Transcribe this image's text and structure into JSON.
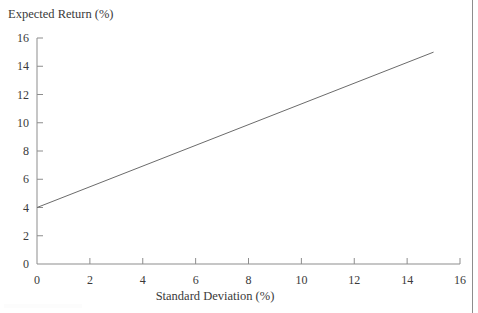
{
  "chart_data": {
    "type": "line",
    "title": "",
    "xlabel": "Standard Deviation (%)",
    "ylabel": "Expected Return (%)",
    "xlim": [
      0,
      16
    ],
    "ylim": [
      0,
      16
    ],
    "xticks": [
      0,
      2,
      4,
      6,
      8,
      10,
      12,
      14,
      16
    ],
    "xtick_labels": [
      "0",
      "2",
      "4",
      "6",
      "8",
      "10",
      "12",
      "14",
      "16"
    ],
    "yticks": [
      0,
      2,
      4,
      6,
      8,
      10,
      12,
      14,
      16
    ],
    "ytick_labels": [
      "0",
      "2",
      "4",
      "6",
      "8",
      "10",
      "12",
      "14",
      "16"
    ],
    "grid": false,
    "legend": "none",
    "series": [
      {
        "name": "Capital Market Line",
        "color": "#6b6b6b",
        "x": [
          0,
          15
        ],
        "values": [
          4,
          15
        ],
        "intercept": 4,
        "slope": 0.7333,
        "endpoint_label": ""
      }
    ],
    "annotations": []
  },
  "axes": {
    "y_title": "Expected Return (%)",
    "x_title": "Standard Deviation (%)",
    "axis_color": "#8d8d8d",
    "tick_color": "#8d8d8d",
    "label_color": "#3a3a3a"
  },
  "decorations": {
    "right_rule_color": "#8d8d8d"
  }
}
